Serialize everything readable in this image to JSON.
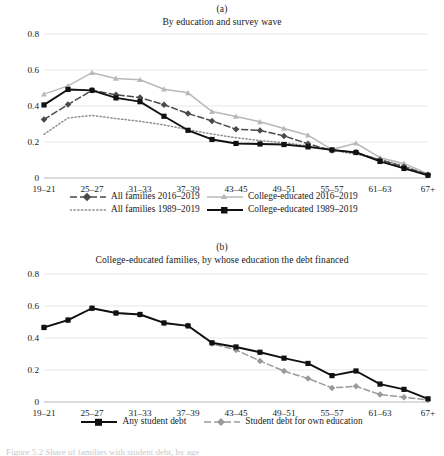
{
  "figure": {
    "background": "#ffffff",
    "caption_partial": "Figure 5.2  Share of families with student debt, by age"
  },
  "panels": [
    {
      "letter": "(a)",
      "title": "By education and survey wave",
      "legend_layout": "two-column-two-row"
    },
    {
      "letter": "(b)",
      "title": "College-educated families, by whose education the debt financed",
      "legend_layout": "one-row"
    }
  ],
  "colors": {
    "black": "#111111",
    "dark_gray": "#4a4a4a",
    "mid_gray": "#8e8e8e",
    "light_gray": "#b9b9b9",
    "grid": "#d8d8d8",
    "axis": "#9a9a9a",
    "text": "#1a1a1a"
  },
  "chart_data": [
    {
      "type": "line",
      "panel": "(a)",
      "title": "By education and survey wave",
      "xlabel": "",
      "ylabel": "",
      "ylim": [
        0,
        0.8
      ],
      "yticks": [
        0,
        0.2,
        0.4,
        0.6,
        0.8
      ],
      "ytick_labels": [
        "0",
        "0.2",
        "0.4",
        "0.6",
        "0.8"
      ],
      "grid": true,
      "legend_position": "below",
      "x": [
        "19-21",
        "22-24",
        "25-27",
        "28-30",
        "31-33",
        "34-36",
        "37-39",
        "40-42",
        "43-45",
        "46-48",
        "49-51",
        "52-54",
        "55-57",
        "58-60",
        "61-63",
        "64-66",
        "67+"
      ],
      "xtick_labels": [
        "19–21",
        "25–27",
        "31–33",
        "37–39",
        "43–45",
        "49–51",
        "55–57",
        "61–63",
        "67+"
      ],
      "xtick_indices": [
        0,
        2,
        4,
        6,
        8,
        10,
        12,
        14,
        16
      ],
      "series": [
        {
          "name": "All families 2016–2019",
          "style": "dashed",
          "color": "#4a4a4a",
          "marker": "diamond",
          "values": [
            0.325,
            0.408,
            0.487,
            0.462,
            0.447,
            0.407,
            0.358,
            0.317,
            0.271,
            0.264,
            0.234,
            0.19,
            0.153,
            0.143,
            0.1,
            0.062,
            0.018
          ]
        },
        {
          "name": "All families 1989–2019",
          "style": "dotted",
          "color": "#8e8e8e",
          "marker": "none",
          "values": [
            0.243,
            0.333,
            0.348,
            0.33,
            0.315,
            0.295,
            0.268,
            0.244,
            0.224,
            0.208,
            0.196,
            0.178,
            0.154,
            0.132,
            0.104,
            0.068,
            0.015
          ]
        },
        {
          "name": "College-educated 2016–2019",
          "style": "solid",
          "color": "#b9b9b9",
          "marker": "triangle",
          "values": [
            0.466,
            0.512,
            0.585,
            0.553,
            0.546,
            0.493,
            0.473,
            0.369,
            0.342,
            0.312,
            0.275,
            0.238,
            0.158,
            0.193,
            0.113,
            0.081,
            0.022
          ]
        },
        {
          "name": "College-educated 1989–2019",
          "style": "solid",
          "color": "#111111",
          "marker": "square",
          "values": [
            0.406,
            0.492,
            0.487,
            0.445,
            0.424,
            0.343,
            0.265,
            0.214,
            0.192,
            0.189,
            0.186,
            0.173,
            0.156,
            0.142,
            0.092,
            0.053,
            0.015
          ]
        }
      ]
    },
    {
      "type": "line",
      "panel": "(b)",
      "title": "College-educated families, by whose education the debt financed",
      "xlabel": "",
      "ylabel": "",
      "ylim": [
        0,
        0.8
      ],
      "yticks": [
        0,
        0.2,
        0.4,
        0.6,
        0.8
      ],
      "ytick_labels": [
        "0",
        "0.2",
        "0.4",
        "0.6",
        "0.8"
      ],
      "grid": true,
      "legend_position": "below",
      "x": [
        "19-21",
        "22-24",
        "25-27",
        "28-30",
        "31-33",
        "34-36",
        "37-39",
        "40-42",
        "43-45",
        "46-48",
        "49-51",
        "52-54",
        "55-57",
        "58-60",
        "61-63",
        "64-66",
        "67+"
      ],
      "xtick_labels": [
        "19–21",
        "25–27",
        "31–33",
        "37–39",
        "43–45",
        "49–51",
        "55–57",
        "61–63",
        "67+"
      ],
      "xtick_indices": [
        0,
        2,
        4,
        6,
        8,
        10,
        12,
        14,
        16
      ],
      "series": [
        {
          "name": "Any student debt",
          "style": "solid",
          "color": "#111111",
          "marker": "square",
          "values": [
            0.466,
            0.512,
            0.586,
            0.556,
            0.547,
            0.494,
            0.476,
            0.37,
            0.344,
            0.311,
            0.274,
            0.241,
            0.165,
            0.194,
            0.112,
            0.079,
            0.02
          ]
        },
        {
          "name": "Student debt for own education",
          "style": "dashed",
          "color": "#9a9a9a",
          "marker": "diamond",
          "values": [
            0.466,
            0.512,
            0.586,
            0.556,
            0.547,
            0.494,
            0.476,
            0.365,
            0.325,
            0.257,
            0.193,
            0.147,
            0.088,
            0.098,
            0.047,
            0.03,
            0.013
          ]
        }
      ]
    }
  ]
}
